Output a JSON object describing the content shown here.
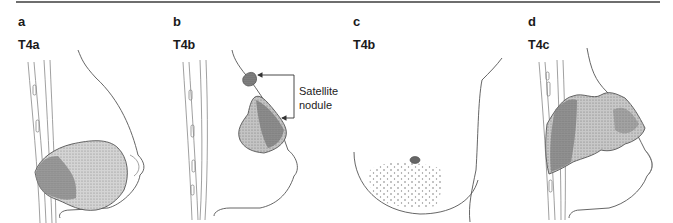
{
  "figure": {
    "panels": [
      {
        "letter": "a",
        "stage": "T4a"
      },
      {
        "letter": "b",
        "stage": "T4b",
        "annotation": {
          "line1": "Satellite",
          "line2": "nodule"
        }
      },
      {
        "letter": "c",
        "stage": "T4b"
      },
      {
        "letter": "d",
        "stage": "T4c"
      }
    ],
    "colors": {
      "rule": "#6e6e6e",
      "outline": "#555555",
      "tumor_light": "#c9c9c9",
      "tumor_dark": "#8a8a8a",
      "label": "#1a1a1a"
    }
  }
}
